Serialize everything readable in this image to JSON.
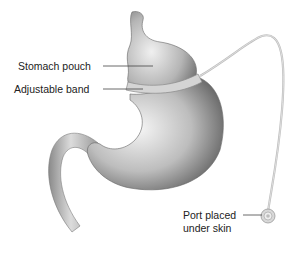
{
  "diagram": {
    "type": "anatomical illustration",
    "labels": {
      "stomach_pouch": "Stomach pouch",
      "adjustable_band": "Adjustable band",
      "port_line1": "Port placed",
      "port_line2": "under skin"
    },
    "colors": {
      "organ_light": "#f2f2f2",
      "organ_dark": "#6e6e6e",
      "band": "#cfcfcf",
      "tube": "#bdbdbd",
      "leader_line": "#444444",
      "text": "#222222"
    }
  }
}
